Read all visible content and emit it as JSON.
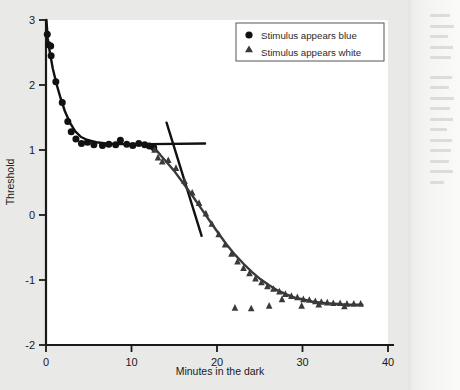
{
  "figure": {
    "background_color": "#e9e9e7",
    "plot_background": "#ffffff",
    "axis_color": "#1a1a1a"
  },
  "legend": {
    "position": "top-right",
    "border_color": "#555555",
    "background": "#ffffff",
    "entries": [
      {
        "marker": "circle-marker",
        "label": "Stimulus appears blue",
        "color": "#111111"
      },
      {
        "marker": "triangle-marker",
        "label": "Stimulus appears white",
        "color": "#3a3a3a"
      }
    ]
  },
  "chart_data": {
    "type": "scatter",
    "title": "",
    "xlabel": "Minutes in the dark",
    "ylabel": "Threshold",
    "xlim": [
      0,
      40
    ],
    "ylim": [
      -2,
      3
    ],
    "xticks": [
      0,
      10,
      20,
      30,
      40
    ],
    "yticks": [
      -2,
      -1,
      0,
      1,
      2,
      3
    ],
    "xtick_labels": [
      "0",
      "10",
      "20",
      "30",
      "40"
    ],
    "ytick_labels": [
      "-2",
      "-1",
      "0",
      "1",
      "2",
      "3"
    ],
    "grid": false,
    "legend_position": "top right",
    "series": [
      {
        "name": "Stimulus appears blue",
        "marker": "circle",
        "color": "#111111",
        "points": [
          [
            0.15,
            2.78
          ],
          [
            0.3,
            2.62
          ],
          [
            0.55,
            2.6
          ],
          [
            0.6,
            2.45
          ],
          [
            1.15,
            2.05
          ],
          [
            1.9,
            1.73
          ],
          [
            2.55,
            1.44
          ],
          [
            2.95,
            1.28
          ],
          [
            3.5,
            1.17
          ],
          [
            4.15,
            1.1
          ],
          [
            4.85,
            1.12
          ],
          [
            5.6,
            1.08
          ],
          [
            6.6,
            1.07
          ],
          [
            7.35,
            1.09
          ],
          [
            8.15,
            1.08
          ],
          [
            8.7,
            1.15
          ],
          [
            9.45,
            1.09
          ],
          [
            10.15,
            1.07
          ],
          [
            10.85,
            1.1
          ],
          [
            11.55,
            1.08
          ],
          [
            12.1,
            1.06
          ],
          [
            12.6,
            1.04
          ]
        ]
      },
      {
        "name": "Stimulus appears white",
        "marker": "triangle",
        "color": "#3a3a3a",
        "points": [
          [
            12.7,
            1.0
          ],
          [
            13.1,
            0.88
          ],
          [
            13.6,
            0.82
          ],
          [
            14.3,
            0.84
          ],
          [
            15.2,
            0.72
          ],
          [
            16.2,
            0.52
          ],
          [
            17.1,
            0.34
          ],
          [
            17.9,
            0.18
          ],
          [
            18.7,
            0.02
          ],
          [
            19.4,
            -0.14
          ],
          [
            20.2,
            -0.3
          ],
          [
            20.95,
            -0.46
          ],
          [
            21.7,
            -0.6
          ],
          [
            22.4,
            -0.72
          ],
          [
            23.1,
            -0.82
          ],
          [
            23.8,
            -0.9
          ],
          [
            24.5,
            -0.98
          ],
          [
            25.2,
            -1.04
          ],
          [
            25.9,
            -1.1
          ],
          [
            26.6,
            -1.14
          ],
          [
            27.3,
            -1.18
          ],
          [
            28.0,
            -1.22
          ],
          [
            28.7,
            -1.25
          ],
          [
            29.4,
            -1.27
          ],
          [
            30.1,
            -1.3
          ],
          [
            30.8,
            -1.31
          ],
          [
            31.5,
            -1.33
          ],
          [
            32.2,
            -1.34
          ],
          [
            32.9,
            -1.35
          ],
          [
            33.6,
            -1.36
          ],
          [
            34.4,
            -1.36
          ],
          [
            35.2,
            -1.37
          ],
          [
            36.0,
            -1.37
          ],
          [
            36.8,
            -1.37
          ],
          [
            22.1,
            -1.43
          ],
          [
            24.0,
            -1.44
          ],
          [
            26.1,
            -1.4
          ],
          [
            27.6,
            -1.3
          ],
          [
            29.9,
            -1.4
          ],
          [
            31.9,
            -1.38
          ],
          [
            34.9,
            -1.41
          ]
        ]
      }
    ],
    "fitted_curves": [
      {
        "name": "cone-branch-curve",
        "description": "Cone adaptation curve falling steeply then plateauing near 1.1",
        "color": "#111111",
        "points": [
          [
            0.05,
            3.0
          ],
          [
            0.2,
            2.72
          ],
          [
            0.45,
            2.5
          ],
          [
            0.8,
            2.25
          ],
          [
            1.2,
            2.03
          ],
          [
            1.7,
            1.8
          ],
          [
            2.2,
            1.6
          ],
          [
            2.8,
            1.42
          ],
          [
            3.4,
            1.29
          ],
          [
            4.1,
            1.2
          ],
          [
            4.9,
            1.15
          ],
          [
            5.9,
            1.12
          ],
          [
            7.0,
            1.1
          ],
          [
            8.5,
            1.09
          ],
          [
            10.0,
            1.09
          ],
          [
            11.5,
            1.08
          ],
          [
            12.6,
            1.06
          ]
        ]
      },
      {
        "name": "cone-plateau-extension-line",
        "description": "Horizontal straight line extending the cone plateau past the break",
        "color": "#111111",
        "points": [
          [
            12.2,
            1.09
          ],
          [
            18.6,
            1.1
          ]
        ]
      },
      {
        "name": "rod-branch-straight-line",
        "description": "Steep straight line showing the rod branch slope crossing the cone plateau",
        "color": "#111111",
        "points": [
          [
            14.1,
            1.42
          ],
          [
            18.2,
            -0.32
          ]
        ]
      },
      {
        "name": "rod-branch-curve",
        "description": "Rod adaptation curve descending to a plateau near -1.37",
        "color": "#3a3a3a",
        "points": [
          [
            12.6,
            1.05
          ],
          [
            13.4,
            0.92
          ],
          [
            14.2,
            0.8
          ],
          [
            15.1,
            0.66
          ],
          [
            16.1,
            0.48
          ],
          [
            17.1,
            0.3
          ],
          [
            18.1,
            0.11
          ],
          [
            19.1,
            -0.08
          ],
          [
            20.1,
            -0.27
          ],
          [
            21.1,
            -0.45
          ],
          [
            22.1,
            -0.61
          ],
          [
            23.1,
            -0.75
          ],
          [
            24.1,
            -0.88
          ],
          [
            25.1,
            -0.99
          ],
          [
            26.1,
            -1.08
          ],
          [
            27.1,
            -1.16
          ],
          [
            28.1,
            -1.22
          ],
          [
            29.1,
            -1.27
          ],
          [
            30.1,
            -1.3
          ],
          [
            31.1,
            -1.33
          ],
          [
            32.1,
            -1.35
          ],
          [
            33.1,
            -1.36
          ],
          [
            34.1,
            -1.37
          ],
          [
            35.1,
            -1.38
          ],
          [
            36.1,
            -1.38
          ],
          [
            37.0,
            -1.38
          ]
        ]
      }
    ]
  }
}
